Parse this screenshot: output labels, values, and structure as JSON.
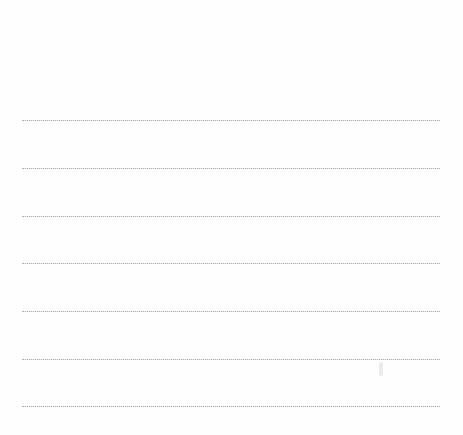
{
  "document": {
    "type": "blank lined paper",
    "line_count": 7,
    "line_color": "#9a9a9a",
    "background_color": "#ffffff",
    "lines": [
      {
        "y": 120
      },
      {
        "y": 168
      },
      {
        "y": 216
      },
      {
        "y": 263
      },
      {
        "y": 311
      },
      {
        "y": 359
      },
      {
        "y": 406
      }
    ]
  }
}
